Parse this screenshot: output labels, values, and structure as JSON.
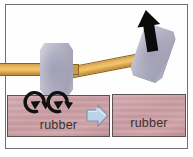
{
  "figure": {
    "frame": {
      "border_color": "#6e7174",
      "background": "#fefefe"
    }
  },
  "panels": {
    "left": {
      "name": "impact-panel",
      "description": "Hammer head resting on rubber block with vibration arrows",
      "block": {
        "label": "rubber",
        "color": "#c79aa0",
        "border_color": "#5d5153"
      },
      "hammer": {
        "head_color": "#b0aec0",
        "handle_color": "#eab95d",
        "state": "struck"
      },
      "vibration_arrows": {
        "name": "oscillation-arrows",
        "count": 2,
        "color": "#111111",
        "meaning": "energy dissipated as vibration"
      }
    },
    "right": {
      "name": "rebound-panel",
      "description": "Hammer lifted away from undeformed rubber block",
      "block": {
        "label": "rubber",
        "color": "#c79aa0",
        "border_color": "#5d5153"
      },
      "hammer": {
        "head_color": "#b0aec0",
        "handle_color": "#eab95d",
        "state": "rebounding",
        "tilt_degrees": 19
      },
      "motion_arrow": {
        "name": "rebound-arrow",
        "direction": "up",
        "color": "#0b0b0b"
      }
    }
  },
  "transition_arrow": {
    "name": "transition-arrow",
    "direction": "right",
    "fill": "#b9cfe4",
    "stroke": "#7a8ea2"
  }
}
